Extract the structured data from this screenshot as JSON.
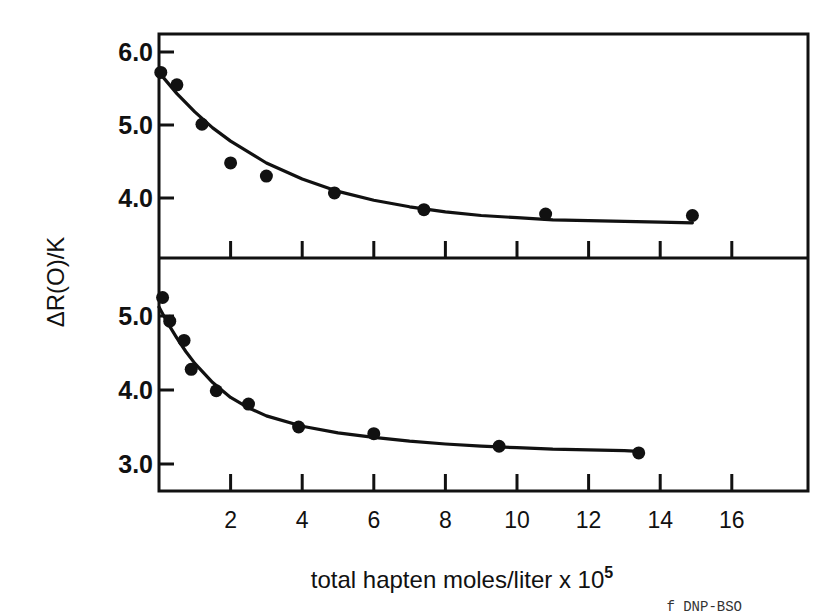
{
  "figure": {
    "y_axis_label": "ΔR(O)/K",
    "x_axis_label": "total hapten moles/liter x 10",
    "x_axis_label_superscript": "5",
    "caption_fragment": "f DNP-BSO"
  },
  "chart_data": {
    "type": "scatter",
    "title": "",
    "xlabel": "total hapten moles/liter x 10^5",
    "ylabel": "ΔR(O)/K",
    "shared_x_axis": true,
    "x_ticks": [
      2,
      4,
      6,
      8,
      10,
      12,
      14,
      16
    ],
    "xlim": [
      0,
      18
    ],
    "grid": false,
    "legend": null,
    "panels": [
      {
        "name": "top",
        "ylim": [
          3.2,
          6.25
        ],
        "y_ticks": [
          4.0,
          5.0,
          6.0
        ],
        "y_tick_labels": [
          "4.0",
          "5.0",
          "6.0"
        ],
        "series": [
          {
            "name": "data points",
            "type": "scatter",
            "x": [
              0.05,
              0.5,
              1.2,
              2.0,
              3.0,
              4.9,
              7.4,
              10.8,
              14.9
            ],
            "y": [
              5.72,
              5.55,
              5.01,
              4.48,
              4.3,
              4.07,
              3.84,
              3.78,
              3.76
            ]
          },
          {
            "name": "fitted curve",
            "type": "line",
            "x": [
              0,
              0.5,
              1,
              1.5,
              2,
              3,
              4,
              5,
              6,
              7,
              8,
              9,
              10,
              11,
              12,
              13,
              14,
              14.9
            ],
            "y": [
              5.72,
              5.43,
              5.18,
              4.96,
              4.78,
              4.48,
              4.26,
              4.09,
              3.97,
              3.88,
              3.81,
              3.76,
              3.73,
              3.7,
              3.69,
              3.68,
              3.67,
              3.66
            ]
          }
        ]
      },
      {
        "name": "bottom",
        "ylim": [
          2.65,
          5.6
        ],
        "y_ticks": [
          3.0,
          4.0,
          5.0
        ],
        "y_tick_labels": [
          "3.0",
          "4.0",
          "5.0"
        ],
        "series": [
          {
            "name": "data points",
            "type": "scatter",
            "x": [
              0.1,
              0.3,
              0.7,
              0.9,
              1.6,
              2.5,
              3.9,
              6.0,
              9.5,
              13.4
            ],
            "y": [
              5.25,
              4.93,
              4.67,
              4.28,
              3.99,
              3.81,
              3.5,
              3.41,
              3.24,
              3.15
            ]
          },
          {
            "name": "fitted curve",
            "type": "line",
            "x": [
              0,
              0.25,
              0.5,
              0.75,
              1,
              1.5,
              2,
              2.5,
              3,
              4,
              5,
              6,
              7,
              8,
              9,
              10,
              11,
              12,
              13,
              13.4
            ],
            "y": [
              5.12,
              4.9,
              4.7,
              4.52,
              4.36,
              4.1,
              3.9,
              3.76,
              3.65,
              3.51,
              3.42,
              3.36,
              3.31,
              3.27,
              3.24,
              3.22,
              3.2,
              3.19,
              3.18,
              3.17
            ]
          }
        ]
      }
    ]
  }
}
